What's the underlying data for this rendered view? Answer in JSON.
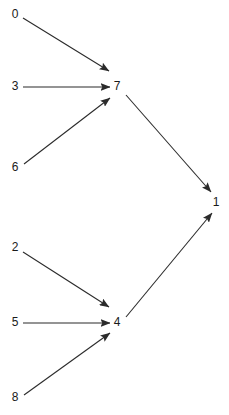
{
  "graph": {
    "type": "directed-graph",
    "background_color": "#ffffff",
    "edge_color": "#2b2b2b",
    "label_color": "#1a1a1a",
    "nodes": [
      {
        "id": "n0",
        "label": "0",
        "x": 15,
        "y": 15
      },
      {
        "id": "n3",
        "label": "3",
        "x": 15,
        "y": 87
      },
      {
        "id": "n6",
        "label": "6",
        "x": 15,
        "y": 168
      },
      {
        "id": "n2",
        "label": "2",
        "x": 15,
        "y": 248
      },
      {
        "id": "n5",
        "label": "5",
        "x": 15,
        "y": 323
      },
      {
        "id": "n8",
        "label": "8",
        "x": 15,
        "y": 398
      },
      {
        "id": "n7",
        "label": "7",
        "x": 117,
        "y": 87
      },
      {
        "id": "n4",
        "label": "4",
        "x": 117,
        "y": 323
      },
      {
        "id": "n1",
        "label": "1",
        "x": 216,
        "y": 203
      }
    ],
    "edges": [
      {
        "id": "e-0-7",
        "from": "0",
        "to": "7",
        "x1": 23,
        "y1": 18,
        "x2": 109,
        "y2": 71
      },
      {
        "id": "e-3-7",
        "from": "3",
        "to": "7",
        "x1": 23,
        "y1": 87,
        "x2": 110,
        "y2": 87
      },
      {
        "id": "e-6-7",
        "from": "6",
        "to": "7",
        "x1": 24,
        "y1": 164,
        "x2": 110,
        "y2": 98
      },
      {
        "id": "e-2-4",
        "from": "2",
        "to": "4",
        "x1": 23,
        "y1": 252,
        "x2": 109,
        "y2": 307
      },
      {
        "id": "e-5-4",
        "from": "5",
        "to": "4",
        "x1": 23,
        "y1": 323,
        "x2": 110,
        "y2": 323
      },
      {
        "id": "e-8-4",
        "from": "8",
        "to": "4",
        "x1": 24,
        "y1": 395,
        "x2": 110,
        "y2": 333
      },
      {
        "id": "e-7-1",
        "from": "7",
        "to": "1",
        "x1": 126,
        "y1": 95,
        "x2": 211,
        "y2": 192
      },
      {
        "id": "e-4-1",
        "from": "4",
        "to": "1",
        "x1": 126,
        "y1": 317,
        "x2": 212,
        "y2": 213
      }
    ]
  }
}
